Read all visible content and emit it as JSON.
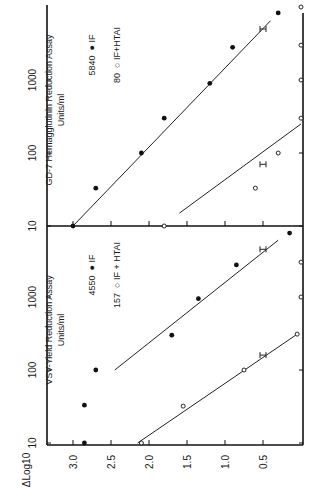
{
  "figure": {
    "orientation": "rotated-90-clockwise",
    "y_axis_label": "ΔLog10",
    "y_ticks": [
      "3.0",
      "2.5",
      "2.0",
      "1.5",
      "1.0",
      "0.5"
    ],
    "x_ticks": [
      "10",
      "100",
      "1000"
    ]
  },
  "panels": [
    {
      "id": "gd7",
      "title": "GD-7 Hemagglutinin Reduction Assay",
      "subtitle": "Units/ml",
      "legend": [
        {
          "value": "5840",
          "marker": "filled-circle",
          "label": "IF"
        },
        {
          "value": "80",
          "marker": "open-circle",
          "label": "IF+HTAI"
        }
      ]
    },
    {
      "id": "vsv",
      "title": "VSV-Yield Reduction Assay",
      "subtitle": "Units/ml",
      "legend": [
        {
          "value": "4550",
          "marker": "filled-circle",
          "label": "IF"
        },
        {
          "value": "157",
          "marker": "open-circle",
          "label": "IF + HTAI"
        }
      ]
    }
  ],
  "chart_data": [
    {
      "type": "scatter",
      "title": "GD-7 Hemagglutinin Reduction Assay",
      "xlabel": "Units/ml",
      "ylabel": "ΔLog10",
      "x_scale": "log",
      "xlim": [
        10,
        20000
      ],
      "ylim": [
        0,
        3.2
      ],
      "x_ticks": [
        10,
        100,
        1000
      ],
      "y_ticks": [
        0.5,
        1.0,
        1.5,
        2.0,
        2.5,
        3.0
      ],
      "series": [
        {
          "name": "IF",
          "marker": "filled-circle",
          "units_per_ml": 5840,
          "x": [
            10,
            33,
            100,
            300,
            900,
            2800,
            8300
          ],
          "y": [
            3.0,
            2.7,
            2.1,
            1.8,
            1.2,
            0.9,
            0.3
          ],
          "fit_line": {
            "x": [
              10,
              6500
            ],
            "y": [
              3.0,
              0.4
            ]
          },
          "error_bar": {
            "x": 5000,
            "y": 0.5
          }
        },
        {
          "name": "IF+HTAI",
          "marker": "open-circle",
          "units_per_ml": 80,
          "x": [
            10,
            33,
            100,
            300,
            1000,
            3000,
            10000
          ],
          "y": [
            1.8,
            0.6,
            0.3,
            0,
            0,
            0,
            0
          ],
          "fit_line": {
            "x": [
              15,
              250
            ],
            "y": [
              1.6,
              0
            ]
          },
          "error_bar": {
            "x": 70,
            "y": 0.5
          }
        }
      ]
    },
    {
      "type": "scatter",
      "title": "VSV-Yield Reduction Assay",
      "xlabel": "Units/ml",
      "ylabel": "ΔLog10",
      "x_scale": "log",
      "xlim": [
        10,
        20000
      ],
      "ylim": [
        0,
        3.2
      ],
      "x_ticks": [
        10,
        100,
        1000
      ],
      "y_ticks": [
        0.5,
        1.0,
        1.5,
        2.0,
        2.5,
        3.0
      ],
      "series": [
        {
          "name": "IF",
          "marker": "filled-circle",
          "units_per_ml": 4550,
          "x": [
            10,
            33,
            100,
            300,
            950,
            2750,
            7500
          ],
          "y": [
            2.85,
            2.85,
            2.7,
            1.7,
            1.35,
            0.85,
            0.15
          ],
          "fit_line": {
            "x": [
              100,
              6000
            ],
            "y": [
              2.45,
              0.3
            ]
          },
          "error_bar": {
            "x": 4500,
            "y": 0.5
          }
        },
        {
          "name": "IF + HTAI",
          "marker": "open-circle",
          "units_per_ml": 157,
          "x": [
            10,
            32,
            100,
            310,
            1000,
            3000
          ],
          "y": [
            2.1,
            1.55,
            0.75,
            0.05,
            0,
            0
          ],
          "fit_line": {
            "x": [
              10,
              310
            ],
            "y": [
              2.15,
              0.05
            ]
          },
          "error_bar": {
            "x": 160,
            "y": 0.5
          }
        }
      ]
    }
  ]
}
